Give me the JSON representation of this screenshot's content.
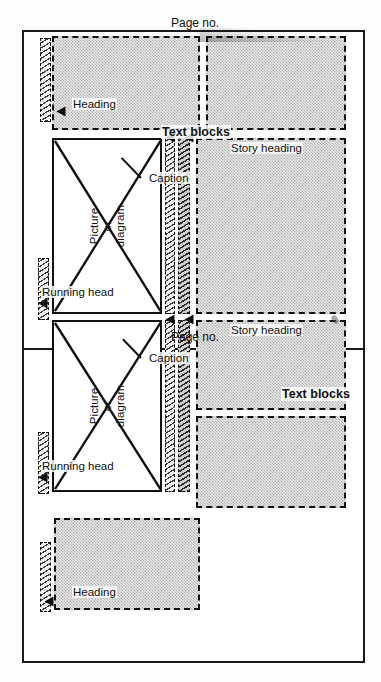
{
  "figure": {
    "kind": "page-layout-diagram",
    "orientation": "rotated-90",
    "panel_count": 2
  },
  "labels": {
    "running_head": "Running head",
    "picture_line1": "Picture",
    "picture_line2": "or",
    "picture_line3": "diagram",
    "caption": "Caption",
    "heading": "Heading",
    "story_heading": "Story heading",
    "text_blocks": "Text blocks",
    "page_no": "Page no."
  },
  "panels": [
    {
      "id": "left-page",
      "page_no": "Page no.",
      "elements": [
        {
          "name": "running-head-rule",
          "type": "rule-bar"
        },
        {
          "name": "picture-box",
          "type": "picture",
          "lines": [
            "Picture",
            "or",
            "diagram"
          ]
        },
        {
          "name": "caption-rule",
          "type": "rule-bar"
        },
        {
          "name": "story-heading-rule",
          "type": "rule-bar"
        },
        {
          "name": "heading-rule",
          "type": "rule-bar"
        },
        {
          "name": "text-block-upper",
          "type": "text-block"
        },
        {
          "name": "text-block-middle",
          "type": "text-block"
        },
        {
          "name": "text-block-lower",
          "type": "text-block"
        }
      ]
    },
    {
      "id": "right-page",
      "page_no": "Page no.",
      "elements": [
        {
          "name": "heading-rule",
          "type": "rule-bar"
        },
        {
          "name": "text-block-upper",
          "type": "text-block"
        },
        {
          "name": "running-head-rule",
          "type": "rule-bar"
        },
        {
          "name": "picture-box",
          "type": "picture",
          "lines": [
            "Picture",
            "or",
            "diagram"
          ]
        },
        {
          "name": "caption-rule",
          "type": "rule-bar"
        },
        {
          "name": "story-heading-rule",
          "type": "rule-bar"
        },
        {
          "name": "text-block-middle",
          "type": "text-block"
        },
        {
          "name": "text-block-lower",
          "type": "text-block"
        }
      ]
    }
  ],
  "colors": {
    "ink": "#111111",
    "block_fill": "#e9e9e9",
    "rule_fill": "#cfcfcf",
    "paper": "#ffffff"
  }
}
